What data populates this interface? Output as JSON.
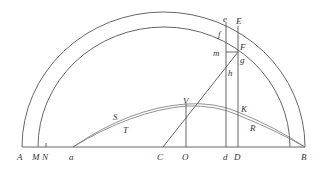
{
  "figure": {
    "type": "geometric-diagram",
    "stroke_color": "#555555",
    "background": "#ffffff"
  },
  "labels": {
    "A": "A",
    "M": "M",
    "N": "N",
    "a": "a",
    "C": "C",
    "O": "O",
    "d": "d",
    "D": "D",
    "B": "B",
    "e": "e",
    "E": "E",
    "f": "f",
    "F": "F",
    "m": "m",
    "g": "g",
    "h": "h",
    "V": "V",
    "K": "K",
    "S": "S",
    "T": "T",
    "R": "R"
  },
  "points": {
    "A": [
      22,
      147
    ],
    "M": [
      38,
      147
    ],
    "N": [
      46,
      147
    ],
    "a": [
      73,
      147
    ],
    "C": [
      163,
      147
    ],
    "O": [
      186,
      147
    ],
    "d": [
      226,
      147
    ],
    "D": [
      238,
      147
    ],
    "B": [
      305,
      147
    ],
    "e": [
      226,
      22
    ],
    "E": [
      238,
      26
    ],
    "F": [
      238,
      52
    ],
    "m": [
      226,
      52
    ],
    "V": [
      186,
      108
    ],
    "K": [
      238,
      115
    ]
  }
}
